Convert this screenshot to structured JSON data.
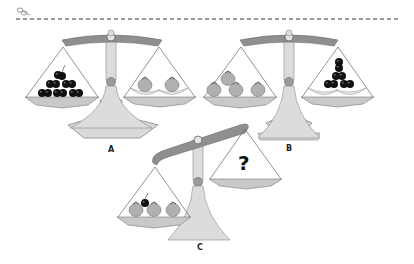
{
  "worksheet": {
    "cut_line": {
      "icon": "scissors-icon",
      "style": "dashed"
    },
    "colors": {
      "beam": "#8f8f8f",
      "post": "#d6d6d6",
      "pan": "#c9c9c9",
      "outline": "#555555",
      "tomato": "#b5b5b5",
      "cherry": "#111111",
      "banana": "#ececec"
    },
    "scales": [
      {
        "id": "A",
        "label": "A",
        "state": "balanced",
        "left_pan": [
          "cherry",
          "cherry",
          "cherry",
          "cherry",
          "cherry",
          "cherry"
        ],
        "right_pan": [
          "tomato",
          "tomato",
          "banana",
          "banana"
        ]
      },
      {
        "id": "B",
        "label": "B",
        "state": "balanced",
        "left_pan": [
          "tomato",
          "tomato",
          "tomato",
          "tomato"
        ],
        "right_pan": [
          "cherry",
          "cherry",
          "cherry",
          "cherry",
          "cherry",
          "cherry",
          "banana",
          "banana"
        ]
      },
      {
        "id": "C",
        "label": "C",
        "state": "tilted-left-down",
        "left_pan": [
          "tomato",
          "tomato",
          "tomato",
          "cherry"
        ],
        "right_pan_text": "?"
      }
    ]
  }
}
